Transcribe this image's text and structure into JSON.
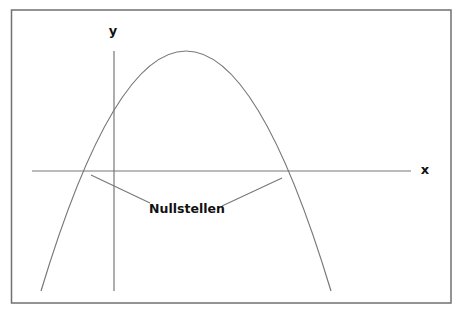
{
  "diagram": {
    "type": "parabola-roots",
    "axis_labels": {
      "x": "x",
      "y": "y"
    },
    "annotation": "Nullstellen",
    "colors": {
      "frame": "#6e6e6e",
      "line": "#6e6e6e",
      "text": "#111111",
      "background": "#ffffff"
    },
    "curve": {
      "shape": "downward parabola",
      "vertex_px": [
        186,
        51
      ],
      "roots_px": [
        [
          84,
          171
        ],
        [
          288,
          171
        ]
      ],
      "endpoints_px": [
        [
          41,
          291
        ],
        [
          331,
          291
        ]
      ]
    }
  }
}
